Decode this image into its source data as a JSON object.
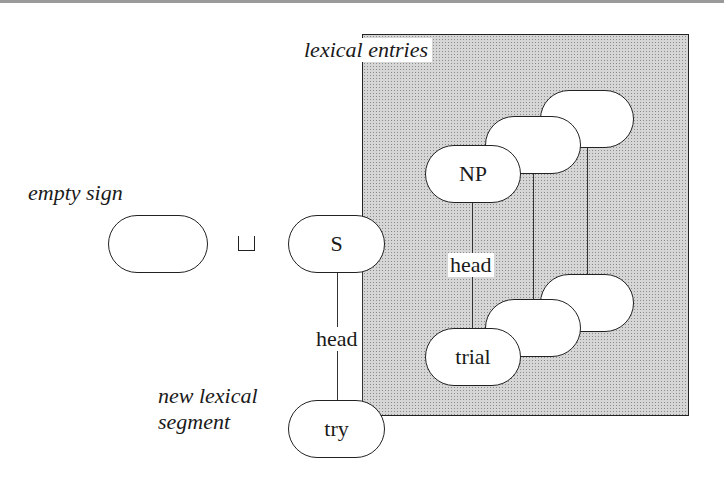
{
  "labels": {
    "lexical_entries": "lexical entries",
    "empty_sign": "empty sign",
    "new_lexical_segment_line1": "new lexical",
    "new_lexical_segment_line2": "segment"
  },
  "operator": {
    "symbol": "⊔",
    "name": "unification / join"
  },
  "nodes": {
    "empty": "",
    "s": "S",
    "try": "try",
    "np": "NP",
    "trial": "trial",
    "stack_top_mid": "",
    "stack_top_back": "",
    "stack_bot_mid": "",
    "stack_bot_back": ""
  },
  "edges": {
    "s_try": "head",
    "np_trial": "head"
  },
  "colors": {
    "stroke": "#222222",
    "box_fill": "#d6d6d6",
    "node_fill": "#ffffff"
  }
}
